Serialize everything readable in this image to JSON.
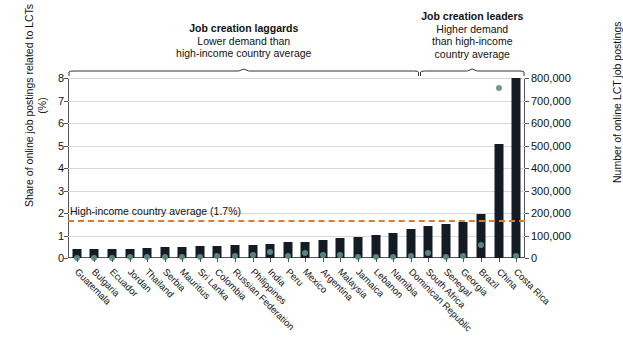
{
  "chart_data": {
    "type": "bar",
    "title": "",
    "ylabel": "Share of online job postings related to LCTs (%)",
    "ylabel_right": "Number of online LCT job postings",
    "xlabel": "",
    "ylim": [
      0,
      8
    ],
    "ylim_right": [
      0,
      800000
    ],
    "yticks": [
      "0",
      "1",
      "2",
      "3",
      "4",
      "5",
      "6",
      "7",
      "8"
    ],
    "yticks_right": [
      "0",
      "100,000",
      "200,000",
      "300,000",
      "400,000",
      "500,000",
      "600,000",
      "700,000",
      "800,000"
    ],
    "grid": true,
    "legend": "none",
    "categories": [
      "Guatemala",
      "Bulgaria",
      "Ecuador",
      "Jordan",
      "Thailand",
      "Serbia",
      "Mauritius",
      "Sri Lanka",
      "Colombia",
      "Russian Federation",
      "Philippines",
      "India",
      "Peru",
      "Mexico",
      "Argentina",
      "Malaysia",
      "Jamaica",
      "Lebanon",
      "Namibia",
      "Dominican Republic",
      "South Africa",
      "Senegal",
      "Georgia",
      "Brazil",
      "China",
      "Costa Rica"
    ],
    "series": [
      {
        "name": "Share of online job postings related to LCTs (%)",
        "type": "bar",
        "color": "#141b25",
        "axis": "left",
        "values": [
          0.38,
          0.38,
          0.38,
          0.4,
          0.45,
          0.5,
          0.5,
          0.52,
          0.55,
          0.58,
          0.6,
          0.64,
          0.7,
          0.72,
          0.8,
          0.88,
          0.95,
          1.02,
          1.1,
          1.3,
          1.42,
          1.52,
          1.6,
          1.95,
          5.05,
          8.0
        ]
      },
      {
        "name": "Number of online LCT job postings",
        "type": "scatter",
        "color": "#5e8f85",
        "axis": "right",
        "values": [
          2000,
          2000,
          2000,
          3000,
          5000,
          6000,
          5000,
          6000,
          9000,
          11000,
          13000,
          27000,
          8000,
          23000,
          12000,
          15000,
          5000,
          6000,
          4000,
          9000,
          22000,
          6000,
          7000,
          58000,
          755000,
          9000
        ]
      }
    ],
    "reference_line": {
      "label": "High-income country average (1.7%)",
      "value": 1.7,
      "color": "#e07b2a",
      "style": "dashed"
    },
    "annotations": [
      {
        "id": "laggards",
        "title": "Job creation laggards",
        "lines": [
          "Lower demand than",
          "high-income country average"
        ],
        "bracket_from_category": "Guatemala",
        "bracket_to_category": "Dominican Republic"
      },
      {
        "id": "leaders",
        "title": "Job creation leaders",
        "lines": [
          "Higher demand",
          "than high-income",
          "country average"
        ],
        "bracket_from_category": "South Africa",
        "bracket_to_category": "Costa Rica"
      }
    ]
  }
}
